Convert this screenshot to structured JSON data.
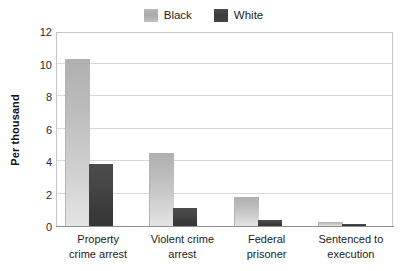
{
  "chart_data": {
    "type": "bar",
    "title": "",
    "subtitle": "",
    "xlabel": "",
    "ylabel": "Per thousand",
    "ylim": [
      0,
      12
    ],
    "yticks": [
      0,
      2,
      4,
      6,
      8,
      10,
      12
    ],
    "ytick_labels": [
      "0",
      "2",
      "4",
      "6",
      "8",
      "10",
      "12"
    ],
    "grid": true,
    "legend_position": "top-center",
    "categories": [
      "Property crime arrest",
      "Violent crime arrest",
      "Federal prisoner",
      "Sentenced to execution"
    ],
    "category_lines": [
      [
        "Property",
        "crime arrest"
      ],
      [
        "Violent crime",
        "arrest"
      ],
      [
        "Federal",
        "prisoner"
      ],
      [
        "Sentenced to",
        "execution"
      ]
    ],
    "series": [
      {
        "name": "Black",
        "color": "#b8b8b8",
        "values": [
          10.3,
          4.5,
          1.8,
          0.25
        ]
      },
      {
        "name": "White",
        "color": "#424242",
        "values": [
          3.8,
          1.1,
          0.4,
          0.1
        ]
      }
    ]
  },
  "legend": {
    "items": [
      {
        "label": "Black",
        "swatch": "series-black"
      },
      {
        "label": "White",
        "swatch": "series-white"
      }
    ]
  },
  "axes": {
    "y_title": "Per thousand"
  }
}
